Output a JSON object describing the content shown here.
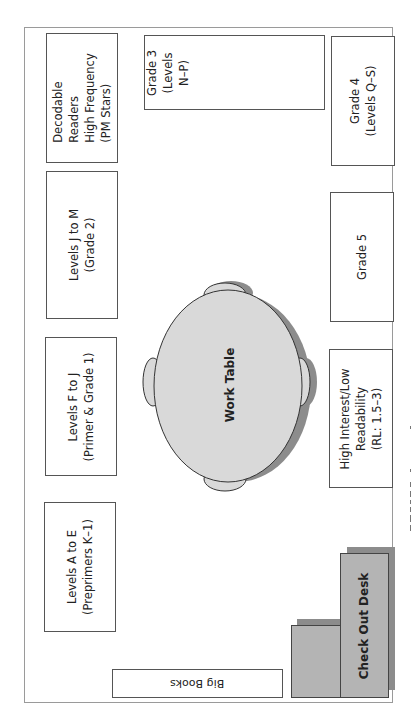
{
  "diagram": {
    "type": "classroom-library-floor-plan",
    "orientation": "rotated-90-ccw",
    "colors": {
      "frame": "#9a9a9a",
      "shelf_border": "#555555",
      "furniture_fill": "#b4b4b4",
      "furniture_shadow": "#8c8c8c",
      "table_fill": "#d9d9d9"
    },
    "left_wall_shelves": [
      {
        "id": "decodable",
        "label": "Decodable\nReaders\nHigh Frequency\n(PM Stars)"
      },
      {
        "id": "levels-j-m",
        "label": "Levels J to M\n(Grade 2)"
      },
      {
        "id": "levels-f-j",
        "label": "Levels F to J\n(Primer & Grade 1)"
      },
      {
        "id": "levels-a-e",
        "label": "Levels A to E\n(Preprimers K–1)"
      }
    ],
    "top_shelf": {
      "id": "grade-3",
      "label": "Grade 3\n(Levels\nN–P)"
    },
    "right_wall_shelves": [
      {
        "id": "grade-4",
        "label": "Grade 4\n(Levels Q–S)"
      },
      {
        "id": "grade-5",
        "label": "Grade 5"
      },
      {
        "id": "high-interest",
        "label": "High Interest/Low\nReadability\n(RL: 1.5–3)"
      }
    ],
    "bottom_shelf": {
      "id": "big-books",
      "label": "Big Books"
    },
    "work_table": {
      "label": "Work Table",
      "chairs": 4
    },
    "check_out_desk": {
      "label": "Check Out Desk"
    }
  }
}
